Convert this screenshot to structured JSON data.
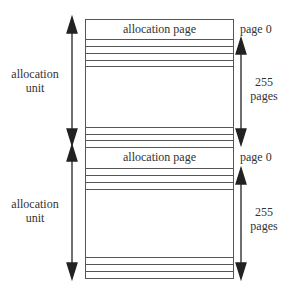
{
  "units": [
    {
      "alloc_page_label": "allocation page",
      "page0_label": "page 0",
      "unit_label_line1": "allocation",
      "unit_label_line2": "unit",
      "pages_count": "255",
      "pages_label": "pages"
    },
    {
      "alloc_page_label": "allocation page",
      "page0_label": "page 0",
      "unit_label_line1": "allocation",
      "unit_label_line2": "unit",
      "pages_count": "255",
      "pages_label": "pages"
    }
  ],
  "colors": {
    "line": "#555555",
    "text": "#333333",
    "arrow": "#222222"
  }
}
